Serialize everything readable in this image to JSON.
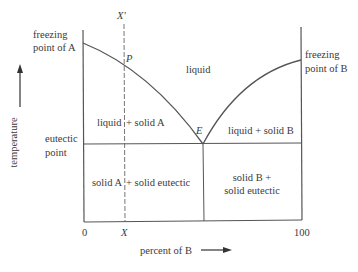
{
  "diagram": {
    "type": "eutectic phase diagram",
    "axes": {
      "y_label": "temperature",
      "x_label": "percent of B",
      "x_min_label": "0",
      "x_max_label": "100",
      "x_marker_label": "X"
    },
    "points": {
      "freezing_a_line1": "freezing",
      "freezing_a_line2": "point of A",
      "freezing_b_line1": "freezing",
      "freezing_b_line2": "point of B",
      "eutectic_line1": "eutectic",
      "eutectic_line2": "point",
      "p_label": "P",
      "e_label": "E",
      "x_prime_label": "X′"
    },
    "regions": {
      "liquid": "liquid",
      "liquid_solid_a_left": "liquid",
      "liquid_solid_a_right": "+ solid A",
      "liquid_solid_b": "liquid + solid B",
      "solid_a_eutectic_left": "solid A",
      "solid_a_eutectic_right": "+ solid eutectic",
      "solid_b_eutectic_line1": "solid B +",
      "solid_b_eutectic_line2": "solid eutectic"
    },
    "colors": {
      "line": "#555555",
      "text": "#3a3a3a"
    }
  }
}
